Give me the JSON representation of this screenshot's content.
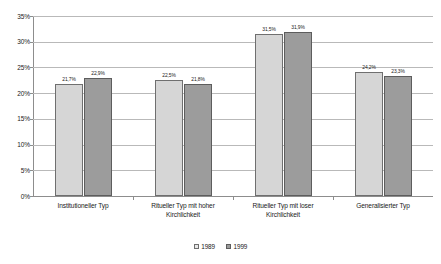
{
  "chart_data": {
    "type": "bar",
    "title": "",
    "subtitle": "",
    "xlabel": "",
    "ylabel": "",
    "ylim": [
      0,
      35
    ],
    "ytick_labels": [
      "0%",
      "5%",
      "10%",
      "15%",
      "20%",
      "25%",
      "30%",
      "35%"
    ],
    "ytick_values": [
      0,
      5,
      10,
      15,
      20,
      25,
      30,
      35
    ],
    "grid": true,
    "legend_position": "bottom-center",
    "value_label_suffix": "%",
    "decimal_separator": ",",
    "categories": [
      "Institutioneller Typ",
      "Ritueller Typ mit hoher Kirchlichkeit",
      "Ritueller Typ mit loser Kirchlichkeit",
      "Generalisierter Typ"
    ],
    "category_lines": [
      [
        "Institutioneller Typ"
      ],
      [
        "Ritueller Typ mit hoher",
        "Kirchlichkeit"
      ],
      [
        "Ritueller Typ mit loser",
        "Kirchlichkeit"
      ],
      [
        "Generalisierter Typ"
      ]
    ],
    "series": [
      {
        "name": "1989",
        "color": "#d6d6d6",
        "values": [
          21.7,
          22.5,
          31.5,
          24.2
        ],
        "value_labels": [
          "21,7%",
          "22,5%",
          "31,5%",
          "24,2%"
        ]
      },
      {
        "name": "1999",
        "color": "#9c9c9c",
        "values": [
          22.9,
          21.8,
          31.9,
          23.3
        ],
        "value_labels": [
          "22,9%",
          "21,8%",
          "31,9%",
          "23,3%"
        ]
      }
    ]
  },
  "legend": {
    "items": [
      {
        "label": "1989"
      },
      {
        "label": "1999"
      }
    ]
  }
}
